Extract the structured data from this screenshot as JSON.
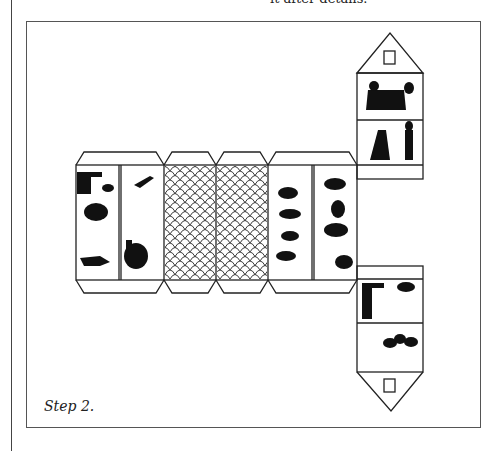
{
  "document": {
    "top_text_fragment": "it after details.",
    "caption": "Step 2.",
    "figure": {
      "description": "Paper house cut-out template with silhouette illustrations",
      "strip_panels": [
        "silhouettes-left",
        "scale-pattern",
        "scale-pattern",
        "silhouettes-right"
      ],
      "gable_panels": [
        "roof-gable-top",
        "roof-gable-bottom"
      ],
      "line_color": "#222222"
    }
  }
}
